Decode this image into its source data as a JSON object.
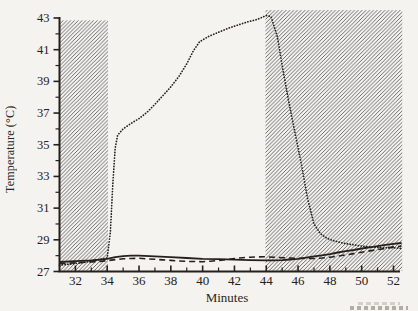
{
  "figure": {
    "paper_color": "#f5f3ef",
    "ink_color": "#24211d",
    "hatch_color": "#5c5c5c"
  },
  "chart_data": {
    "type": "line",
    "title": "",
    "xlabel": "Minutes",
    "ylabel": "Temperature (°C)",
    "xlim": [
      31,
      52
    ],
    "ylim": [
      27,
      43
    ],
    "grid": false,
    "legend": "none",
    "x_major_ticks": [
      32,
      34,
      36,
      38,
      40,
      42,
      44,
      46,
      48,
      50,
      52
    ],
    "x_minor_ticks": [
      33,
      35,
      37,
      39,
      41,
      43,
      45,
      47,
      49,
      51
    ],
    "y_major_ticks": [
      27,
      29,
      31,
      33,
      35,
      37,
      39,
      41,
      43
    ],
    "y_minor_ticks": [
      28,
      30,
      32,
      34,
      36,
      38,
      40,
      42
    ],
    "shaded_regions": [
      {
        "name": "left-hatched-band",
        "x_start": 31,
        "x_end": 34.05,
        "t_top": 42.85,
        "style": "diagonal-hatch"
      },
      {
        "name": "right-hatched-band",
        "x_start": 43.95,
        "x_end": 52.55,
        "t_top": 43.5,
        "style": "diagonal-hatch"
      }
    ],
    "series": [
      {
        "name": "dotted-curve",
        "style": "dotted",
        "points": [
          [
            31,
            27.4
          ],
          [
            32,
            27.5
          ],
          [
            33,
            27.65
          ],
          [
            34,
            27.85
          ],
          [
            34.2,
            29.5
          ],
          [
            34.35,
            32.5
          ],
          [
            34.5,
            34.8
          ],
          [
            34.65,
            35.6
          ],
          [
            35,
            36.0
          ],
          [
            35.5,
            36.35
          ],
          [
            36,
            36.65
          ],
          [
            36.5,
            37.05
          ],
          [
            37,
            37.55
          ],
          [
            37.5,
            38.1
          ],
          [
            38,
            38.65
          ],
          [
            38.5,
            39.3
          ],
          [
            39,
            40.1
          ],
          [
            39.4,
            40.9
          ],
          [
            39.8,
            41.5
          ],
          [
            40.4,
            41.85
          ],
          [
            41,
            42.1
          ],
          [
            41.6,
            42.35
          ],
          [
            42.2,
            42.55
          ],
          [
            42.8,
            42.75
          ],
          [
            43.4,
            42.9
          ],
          [
            44.0,
            43.15
          ],
          [
            44.3,
            43.1
          ],
          [
            44.7,
            41.8
          ],
          [
            45.0,
            40.0
          ],
          [
            45.4,
            37.8
          ],
          [
            45.8,
            35.8
          ],
          [
            46.2,
            33.8
          ],
          [
            46.6,
            31.6
          ],
          [
            47.0,
            30.0
          ],
          [
            47.4,
            29.4
          ],
          [
            47.8,
            29.1
          ],
          [
            48.2,
            28.95
          ],
          [
            48.8,
            28.8
          ],
          [
            49.4,
            28.7
          ],
          [
            50,
            28.6
          ],
          [
            50.6,
            28.55
          ],
          [
            51.2,
            28.5
          ],
          [
            52,
            28.5
          ],
          [
            52.5,
            28.45
          ]
        ]
      },
      {
        "name": "dashed-curve",
        "style": "dashed",
        "points": [
          [
            31,
            27.5
          ],
          [
            32,
            27.55
          ],
          [
            33,
            27.6
          ],
          [
            34,
            27.68
          ],
          [
            34.5,
            27.75
          ],
          [
            35,
            27.8
          ],
          [
            35.5,
            27.82
          ],
          [
            36,
            27.83
          ],
          [
            36.5,
            27.8
          ],
          [
            37,
            27.77
          ],
          [
            37.5,
            27.73
          ],
          [
            38,
            27.7
          ],
          [
            38.5,
            27.67
          ],
          [
            39,
            27.64
          ],
          [
            40,
            27.62
          ],
          [
            40.5,
            27.65
          ],
          [
            41,
            27.7
          ],
          [
            41.5,
            27.76
          ],
          [
            42,
            27.82
          ],
          [
            42.5,
            27.87
          ],
          [
            43,
            27.9
          ],
          [
            43.5,
            27.92
          ],
          [
            44,
            27.93
          ],
          [
            44.5,
            27.9
          ],
          [
            45,
            27.87
          ],
          [
            45.5,
            27.85
          ],
          [
            46,
            27.83
          ],
          [
            46.5,
            27.82
          ],
          [
            47,
            27.82
          ],
          [
            47.5,
            27.85
          ],
          [
            48,
            27.9
          ],
          [
            48.5,
            27.97
          ],
          [
            49,
            28.05
          ],
          [
            49.5,
            28.13
          ],
          [
            50,
            28.22
          ],
          [
            50.5,
            28.3
          ],
          [
            51,
            28.38
          ],
          [
            51.5,
            28.46
          ],
          [
            52,
            28.55
          ],
          [
            52.5,
            28.6
          ]
        ]
      },
      {
        "name": "solid-curve",
        "style": "solid",
        "points": [
          [
            31,
            27.6
          ],
          [
            32,
            27.65
          ],
          [
            33,
            27.7
          ],
          [
            34,
            27.8
          ],
          [
            34.5,
            27.9
          ],
          [
            35,
            27.97
          ],
          [
            35.5,
            28.0
          ],
          [
            36,
            28.0
          ],
          [
            37,
            27.95
          ],
          [
            38,
            27.9
          ],
          [
            39,
            27.85
          ],
          [
            40,
            27.8
          ],
          [
            41,
            27.78
          ],
          [
            42,
            27.75
          ],
          [
            43,
            27.72
          ],
          [
            44,
            27.7
          ],
          [
            44.5,
            27.7
          ],
          [
            45,
            27.72
          ],
          [
            45.5,
            27.76
          ],
          [
            46,
            27.8
          ],
          [
            46.5,
            27.87
          ],
          [
            47,
            27.95
          ],
          [
            47.5,
            28.02
          ],
          [
            48,
            28.1
          ],
          [
            48.5,
            28.2
          ],
          [
            49,
            28.28
          ],
          [
            49.5,
            28.36
          ],
          [
            50,
            28.45
          ],
          [
            50.5,
            28.52
          ],
          [
            51,
            28.6
          ],
          [
            51.5,
            28.68
          ],
          [
            52,
            28.75
          ],
          [
            52.5,
            28.8
          ]
        ]
      }
    ]
  }
}
